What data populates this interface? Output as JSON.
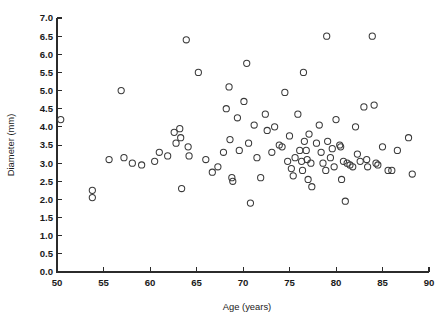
{
  "chart_data": {
    "type": "scatter",
    "title": "",
    "xlabel": "Age (years)",
    "ylabel": "Diameter (mm)",
    "xlim": [
      50,
      90
    ],
    "ylim": [
      0.0,
      7.0
    ],
    "xticks": [
      50,
      55,
      60,
      65,
      70,
      75,
      80,
      85,
      90
    ],
    "xtick_labels": [
      "50",
      "55",
      "60",
      "65",
      "70",
      "75",
      "80",
      "85",
      "90"
    ],
    "yticks": [
      0.0,
      0.5,
      1.0,
      1.5,
      2.0,
      2.5,
      3.0,
      3.5,
      4.0,
      4.5,
      5.0,
      5.5,
      6.0,
      6.5,
      7.0
    ],
    "ytick_labels": [
      "0.0",
      "0.5",
      "1.0",
      "1.5",
      "2.0",
      "2.5",
      "3.0",
      "3.5",
      "4.0",
      "4.5",
      "5.0",
      "5.5",
      "6.0",
      "6.5",
      "7.0"
    ],
    "grid": false,
    "legend": false,
    "marker": "open-circle",
    "marker_color": "#3a3a3a",
    "marker_radius_px": 3.1,
    "n_points": 97,
    "series": [
      {
        "name": "aneurysm",
        "points": [
          [
            50.4,
            4.2
          ],
          [
            53.8,
            2.25
          ],
          [
            53.8,
            2.05
          ],
          [
            55.6,
            3.1
          ],
          [
            56.9,
            5.0
          ],
          [
            57.2,
            3.15
          ],
          [
            58.1,
            3.0
          ],
          [
            59.1,
            2.95
          ],
          [
            60.5,
            3.05
          ],
          [
            61.0,
            3.3
          ],
          [
            61.9,
            3.2
          ],
          [
            62.6,
            3.85
          ],
          [
            62.8,
            3.55
          ],
          [
            63.2,
            3.95
          ],
          [
            63.3,
            3.7
          ],
          [
            63.4,
            2.3
          ],
          [
            63.9,
            6.4
          ],
          [
            64.1,
            3.45
          ],
          [
            64.2,
            3.2
          ],
          [
            65.2,
            5.5
          ],
          [
            66.0,
            3.1
          ],
          [
            66.7,
            2.75
          ],
          [
            67.3,
            2.9
          ],
          [
            67.9,
            3.3
          ],
          [
            68.2,
            4.5
          ],
          [
            68.5,
            5.1
          ],
          [
            68.6,
            3.65
          ],
          [
            68.8,
            2.6
          ],
          [
            68.9,
            2.5
          ],
          [
            69.4,
            4.25
          ],
          [
            69.6,
            3.35
          ],
          [
            70.1,
            4.7
          ],
          [
            70.4,
            5.75
          ],
          [
            70.6,
            3.55
          ],
          [
            70.8,
            1.9
          ],
          [
            71.2,
            4.05
          ],
          [
            71.5,
            3.15
          ],
          [
            71.9,
            2.6
          ],
          [
            72.4,
            4.35
          ],
          [
            72.6,
            3.9
          ],
          [
            73.1,
            3.3
          ],
          [
            73.4,
            4.0
          ],
          [
            73.9,
            3.5
          ],
          [
            74.2,
            3.45
          ],
          [
            74.5,
            4.95
          ],
          [
            74.8,
            3.05
          ],
          [
            75.0,
            3.75
          ],
          [
            75.2,
            2.85
          ],
          [
            75.4,
            2.65
          ],
          [
            75.6,
            3.15
          ],
          [
            75.9,
            4.35
          ],
          [
            76.1,
            3.35
          ],
          [
            76.3,
            3.05
          ],
          [
            76.4,
            2.8
          ],
          [
            76.5,
            5.5
          ],
          [
            76.6,
            3.6
          ],
          [
            76.8,
            3.35
          ],
          [
            76.9,
            3.1
          ],
          [
            77.0,
            2.55
          ],
          [
            77.1,
            3.8
          ],
          [
            77.3,
            3.0
          ],
          [
            77.4,
            2.35
          ],
          [
            77.9,
            3.55
          ],
          [
            78.2,
            4.05
          ],
          [
            78.4,
            3.3
          ],
          [
            78.6,
            3.0
          ],
          [
            78.9,
            2.8
          ],
          [
            79.0,
            6.5
          ],
          [
            79.1,
            3.6
          ],
          [
            79.4,
            3.15
          ],
          [
            79.6,
            3.4
          ],
          [
            79.8,
            2.9
          ],
          [
            80.0,
            4.2
          ],
          [
            80.4,
            3.5
          ],
          [
            80.5,
            3.45
          ],
          [
            80.6,
            2.55
          ],
          [
            80.8,
            3.05
          ],
          [
            81.0,
            1.95
          ],
          [
            81.2,
            3.0
          ],
          [
            81.5,
            2.95
          ],
          [
            81.8,
            2.9
          ],
          [
            82.1,
            4.0
          ],
          [
            82.3,
            3.25
          ],
          [
            82.6,
            3.05
          ],
          [
            83.0,
            4.55
          ],
          [
            83.3,
            3.1
          ],
          [
            83.4,
            2.9
          ],
          [
            83.9,
            6.5
          ],
          [
            84.1,
            4.6
          ],
          [
            84.3,
            3.0
          ],
          [
            84.5,
            2.95
          ],
          [
            85.0,
            3.45
          ],
          [
            85.6,
            2.8
          ],
          [
            86.0,
            2.8
          ],
          [
            86.6,
            3.35
          ],
          [
            87.8,
            3.7
          ],
          [
            88.2,
            2.7
          ]
        ]
      }
    ]
  }
}
